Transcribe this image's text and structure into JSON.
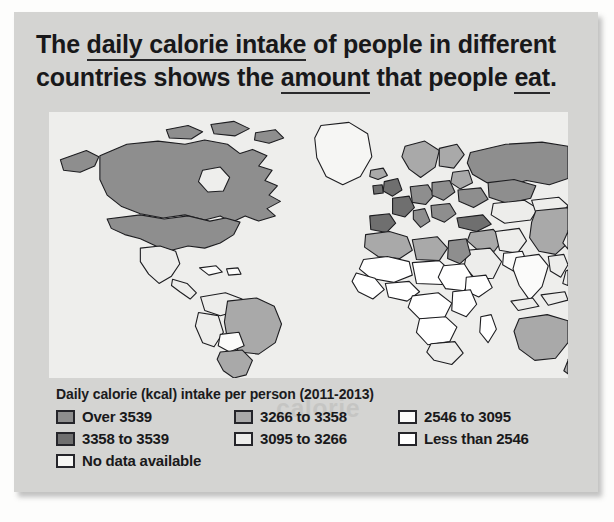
{
  "heading": {
    "segments": [
      {
        "text": "The ",
        "underline": false
      },
      {
        "text": "daily calorie intake",
        "underline": true
      },
      {
        "text": " of people in different countries shows the ",
        "underline": false
      },
      {
        "text": "amount",
        "underline": true
      },
      {
        "text": " that people ",
        "underline": false
      },
      {
        "text": "eat",
        "underline": true
      },
      {
        "text": ".",
        "underline": false
      }
    ],
    "full_text": "The daily calorie intake of people in different countries shows the amount that people eat."
  },
  "ghost_text": [
    {
      "text": "shows the",
      "x": 292,
      "y": 96
    },
    {
      "text": "of people in different",
      "x": 186,
      "y": 188
    },
    {
      "text": "shows the amount",
      "x": 146,
      "y": 238
    },
    {
      "text": "countries shows the amount th",
      "x": 40,
      "y": 286
    },
    {
      "text": "intake of people",
      "x": 214,
      "y": 336
    },
    {
      "text": "calorie",
      "x": 262,
      "y": 382
    }
  ],
  "chart_data": {
    "type": "map",
    "title": "Daily calorie (kcal) intake per person (2011-2013)",
    "legend_position": "below-map",
    "classes": [
      {
        "label": "Over 3539",
        "color": "#8e8e8e",
        "order": 1
      },
      {
        "label": "3358 to 3539",
        "color": "#6f6f6f",
        "order": 2
      },
      {
        "label": "3266 to 3358",
        "color": "#a9a9a9",
        "order": 3
      },
      {
        "label": "3095 to 3266",
        "color": "#ededeb",
        "order": 4
      },
      {
        "label": "2546 to 3095",
        "color": "#fbfbfa",
        "order": 5
      },
      {
        "label": "Less than 2546",
        "color": "#ffffff",
        "order": 6
      },
      {
        "label": "No data available",
        "color": "#f6f6f4",
        "order": 7
      }
    ],
    "regions": [
      {
        "name": "Canada",
        "class": 1
      },
      {
        "name": "United States",
        "class": 1
      },
      {
        "name": "Greenland",
        "class": 7
      },
      {
        "name": "Mexico",
        "class": 4
      },
      {
        "name": "Central America",
        "class": 4
      },
      {
        "name": "Caribbean",
        "class": 5
      },
      {
        "name": "Brazil",
        "class": 3
      },
      {
        "name": "Argentina",
        "class": 3
      },
      {
        "name": "Chile",
        "class": 3
      },
      {
        "name": "Bolivia",
        "class": 5
      },
      {
        "name": "Peru",
        "class": 4
      },
      {
        "name": "Colombia",
        "class": 4
      },
      {
        "name": "Venezuela",
        "class": 4
      },
      {
        "name": "Western Europe",
        "class": 2
      },
      {
        "name": "Central Europe",
        "class": 1
      },
      {
        "name": "Scandinavia",
        "class": 3
      },
      {
        "name": "Russia",
        "class": 1
      },
      {
        "name": "Turkey",
        "class": 2
      },
      {
        "name": "Kazakhstan",
        "class": 4
      },
      {
        "name": "Mongolia",
        "class": 4
      },
      {
        "name": "China",
        "class": 3
      },
      {
        "name": "India",
        "class": 5
      },
      {
        "name": "Southeast Asia",
        "class": 4
      },
      {
        "name": "Indonesia",
        "class": 4
      },
      {
        "name": "Japan",
        "class": 4
      },
      {
        "name": "Australia",
        "class": 3
      },
      {
        "name": "New Zealand",
        "class": 3
      },
      {
        "name": "Egypt",
        "class": 1
      },
      {
        "name": "North Africa",
        "class": 3
      },
      {
        "name": "Sahel",
        "class": 6
      },
      {
        "name": "Central Africa",
        "class": 6
      },
      {
        "name": "East Africa",
        "class": 6
      },
      {
        "name": "Southern Africa",
        "class": 4
      },
      {
        "name": "South Africa",
        "class": 4
      },
      {
        "name": "Madagascar",
        "class": 6
      },
      {
        "name": "Arabian Peninsula",
        "class": 4
      }
    ]
  }
}
